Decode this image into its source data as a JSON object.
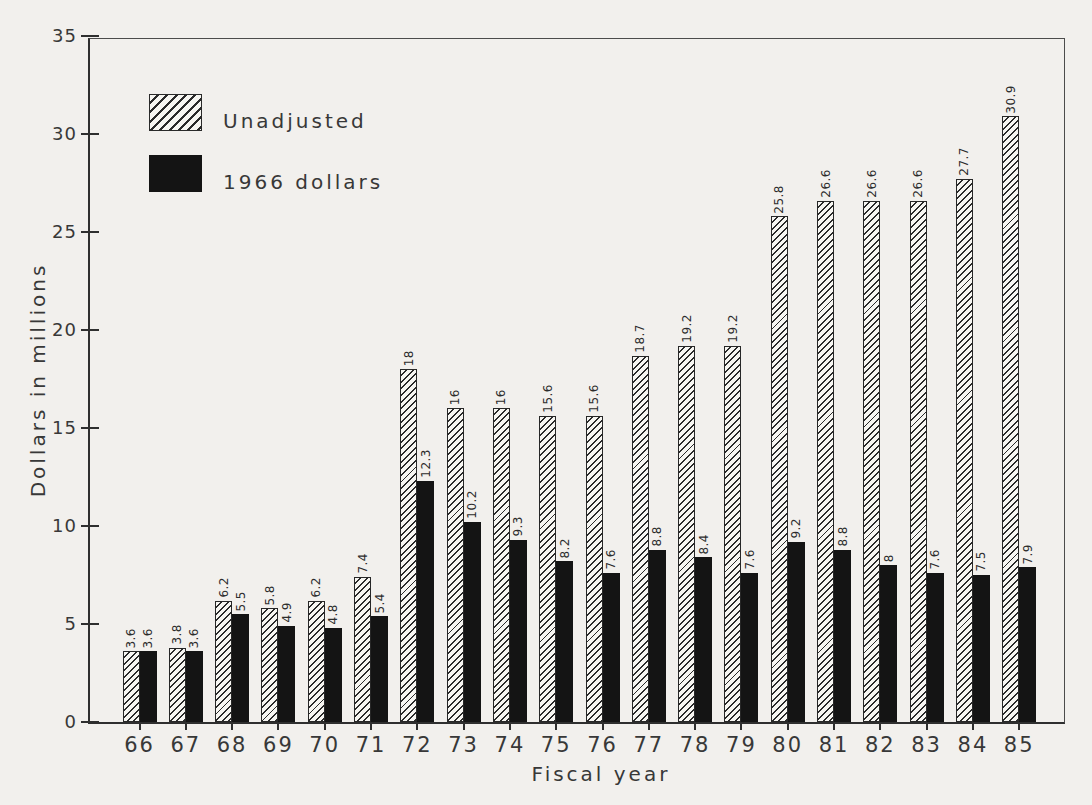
{
  "chart_data": {
    "type": "bar",
    "title": "",
    "xlabel": "Fiscal year",
    "ylabel": "Dollars in millions",
    "ylim": [
      0,
      35
    ],
    "yticks": [
      0,
      5,
      10,
      15,
      20,
      25,
      30,
      35
    ],
    "grid": false,
    "legend_position": "top-left-inside",
    "bar_value_labels": "rotated-vertical-above-bar",
    "categories": [
      "66",
      "67",
      "68",
      "69",
      "70",
      "71",
      "72",
      "73",
      "74",
      "75",
      "76",
      "77",
      "78",
      "79",
      "80",
      "81",
      "82",
      "83",
      "84",
      "85"
    ],
    "series": [
      {
        "name": "Unadjusted",
        "style": "hatched",
        "values": [
          3.6,
          3.8,
          6.2,
          5.8,
          6.2,
          7.4,
          18,
          16,
          16,
          15.6,
          15.6,
          18.7,
          19.2,
          19.2,
          25.8,
          26.6,
          26.6,
          26.6,
          27.7,
          30.9
        ],
        "labels": [
          "3.6",
          "3.8",
          "6.2",
          "5.8",
          "6.2",
          "7.4",
          "18",
          "16",
          "16",
          "15.6",
          "15.6",
          "18.7",
          "19.2",
          "19.2",
          "25.8",
          "26.6",
          "26.6",
          "26.6",
          "27.7",
          "30.9"
        ]
      },
      {
        "name": "1966 dollars",
        "style": "solid-black",
        "values": [
          3.6,
          3.6,
          5.5,
          4.9,
          4.8,
          5.4,
          12.3,
          10.2,
          9.3,
          8.2,
          7.6,
          8.8,
          8.4,
          7.6,
          9.2,
          8.8,
          8,
          7.6,
          7.5,
          7.9
        ],
        "labels": [
          "3.6",
          "3.6",
          "5.5",
          "4.9",
          "4.8",
          "5.4",
          "12.3",
          "10.2",
          "9.3",
          "8.2",
          "7.6",
          "8.8",
          "8.4",
          "7.6",
          "9.2",
          "8.8",
          "8",
          "7.6",
          "7.5",
          "7.9"
        ]
      }
    ]
  },
  "colors": {
    "background": "#f2f0ed",
    "ink": "#2f2f2f",
    "bar_black": "#141414",
    "bar_white": "#f7f6f2"
  }
}
